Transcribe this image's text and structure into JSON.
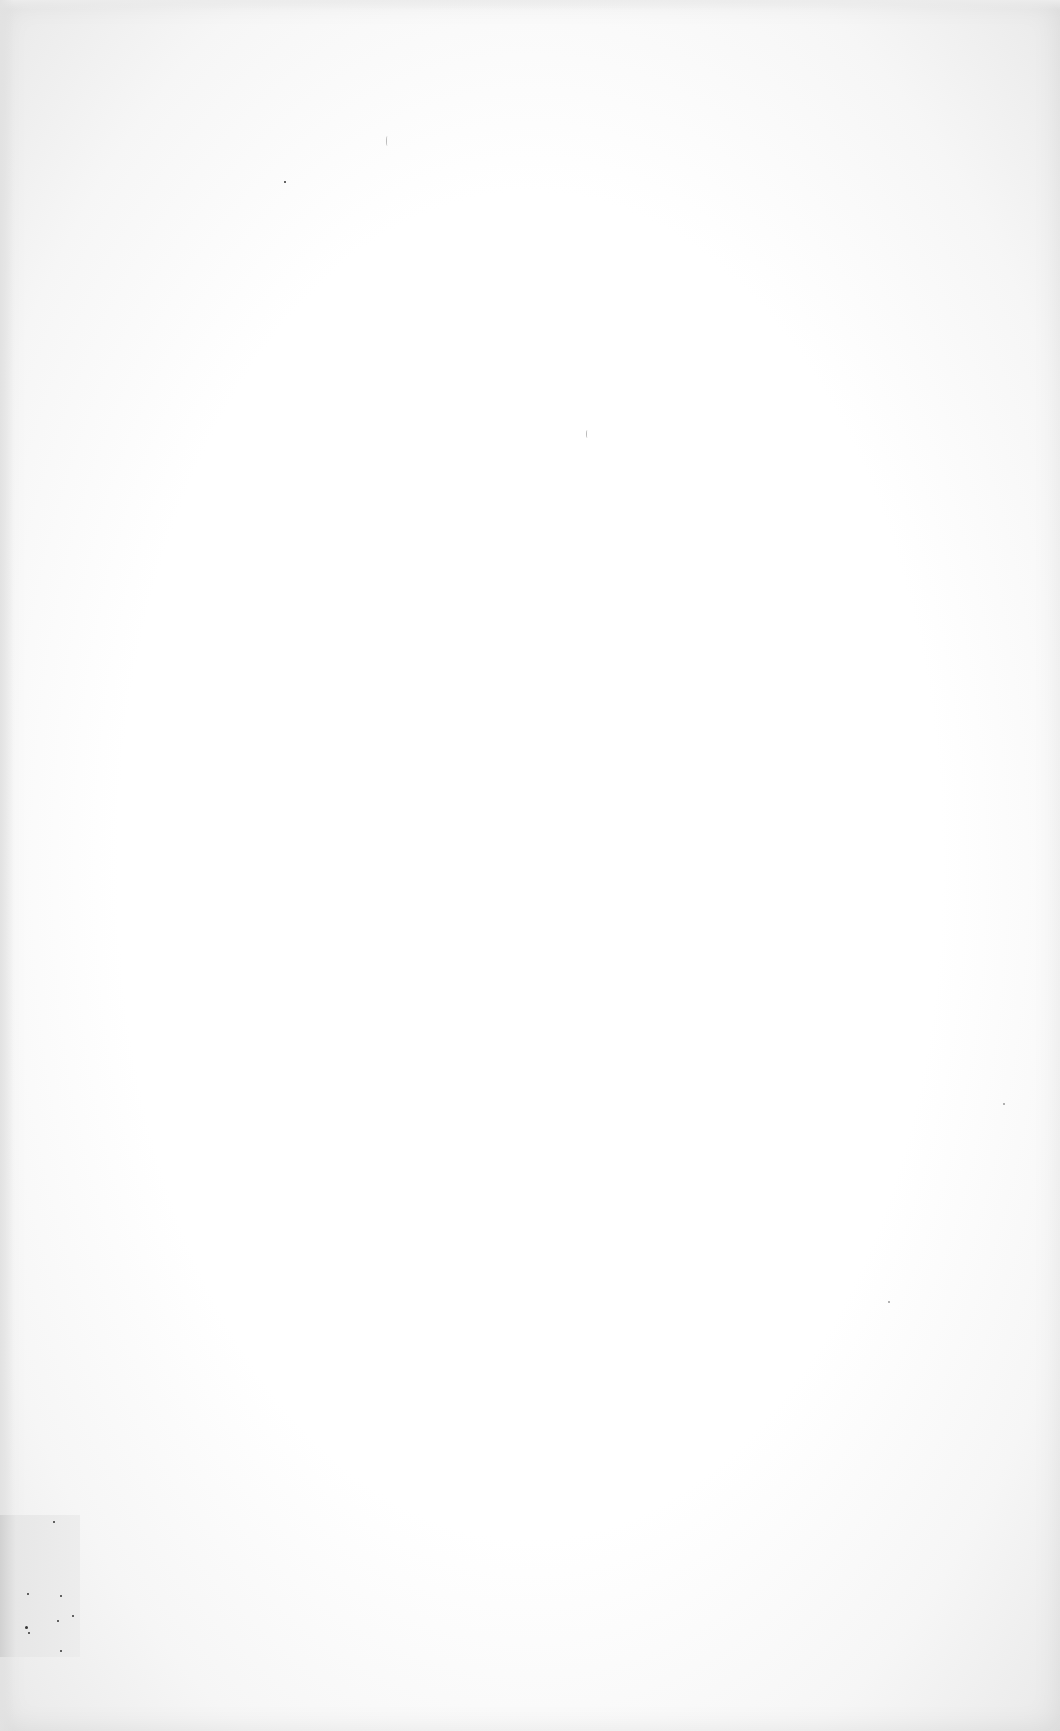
{
  "document": {
    "type": "scanned-page",
    "content": "blank",
    "text": ""
  },
  "colors": {
    "paper": "#ffffff",
    "edge_shadow": "#e2e2e2",
    "smudge": "#d6d6d6"
  }
}
